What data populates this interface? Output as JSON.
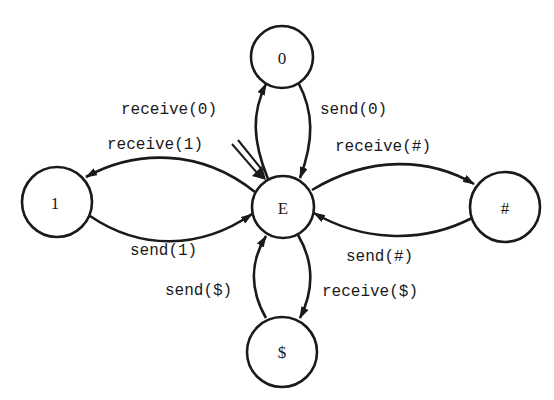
{
  "diagram": {
    "type": "state-machine",
    "start_state": "E",
    "colors": {
      "stroke": "#1a1a1a",
      "background": "#ffffff"
    },
    "nodes": [
      {
        "id": "E",
        "label": "E"
      },
      {
        "id": "0",
        "label": "0"
      },
      {
        "id": "1",
        "label": "1"
      },
      {
        "id": "#",
        "label": "#"
      },
      {
        "id": "$",
        "label": "$"
      }
    ],
    "edges": [
      {
        "from": "E",
        "to": "0",
        "label": "receive(0)"
      },
      {
        "from": "0",
        "to": "E",
        "label": "send(0)"
      },
      {
        "from": "E",
        "to": "1",
        "label": "receive(1)"
      },
      {
        "from": "1",
        "to": "E",
        "label": "send(1)"
      },
      {
        "from": "E",
        "to": "#",
        "label": "receive(#)"
      },
      {
        "from": "#",
        "to": "E",
        "label": "send(#)"
      },
      {
        "from": "E",
        "to": "$",
        "label": "receive($)"
      },
      {
        "from": "$",
        "to": "E",
        "label": "send($)"
      }
    ]
  }
}
